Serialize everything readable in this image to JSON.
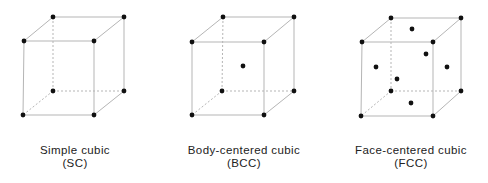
{
  "colors": {
    "edge": "#b5b5b5",
    "atom": "#111111",
    "text": "#222222"
  },
  "structures": [
    {
      "name": "Simple cubic",
      "abbr": "(SC)",
      "label_x": 75,
      "corners": {
        "btl": [
          53,
          17
        ],
        "btr": [
          124,
          17
        ],
        "ftl": [
          24,
          41
        ],
        "ftr": [
          94,
          41
        ],
        "bbl": [
          53,
          91
        ],
        "bbr": [
          124,
          91
        ],
        "fbl": [
          23,
          115
        ],
        "fbr": [
          94,
          115
        ]
      },
      "extra_atoms": []
    },
    {
      "name": "Body-centered cubic",
      "abbr": "(BCC)",
      "label_x": 244,
      "corners": {
        "btl": [
          223,
          17
        ],
        "btr": [
          294,
          17
        ],
        "ftl": [
          192,
          42
        ],
        "ftr": [
          264,
          42
        ],
        "bbl": [
          222,
          91
        ],
        "bbr": [
          294,
          91
        ],
        "fbl": [
          192,
          115
        ],
        "fbr": [
          264,
          115
        ]
      },
      "extra_atoms": [
        [
          243,
          66
        ]
      ]
    },
    {
      "name": "Face-centered cubic",
      "abbr": "(FCC)",
      "label_x": 411,
      "corners": {
        "btl": [
          391,
          18
        ],
        "btr": [
          461,
          18
        ],
        "ftl": [
          362,
          42
        ],
        "ftr": [
          433,
          42
        ],
        "bbl": [
          391,
          91
        ],
        "bbr": [
          461,
          91
        ],
        "fbl": [
          361,
          116
        ],
        "fbr": [
          433,
          116
        ]
      },
      "extra_atoms": [
        [
          412,
          29
        ],
        [
          426,
          54
        ],
        [
          376,
          67
        ],
        [
          447,
          67
        ],
        [
          397,
          79
        ],
        [
          411,
          103
        ]
      ]
    }
  ]
}
